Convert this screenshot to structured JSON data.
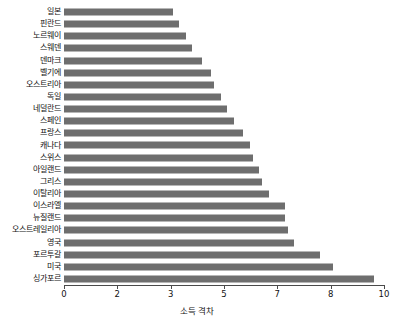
{
  "chart_data": {
    "type": "bar",
    "orientation": "horizontal",
    "title": "",
    "subtitle": "",
    "xlabel": "소득 격차",
    "ylabel": "",
    "xlim": [
      0,
      10
    ],
    "ylim": null,
    "grid": false,
    "legend": null,
    "legend_position": "none",
    "bar_color": "#6e6e6e",
    "axis_color": "#4a4a4a",
    "background_color": "#ffffff",
    "x_ticks": [
      {
        "value": 0,
        "label": "0"
      },
      {
        "value": 1.6667,
        "label": "2"
      },
      {
        "value": 3.3333,
        "label": "3"
      },
      {
        "value": 5,
        "label": "5"
      },
      {
        "value": 6.6667,
        "label": "7"
      },
      {
        "value": 8.3333,
        "label": "8"
      },
      {
        "value": 10,
        "label": "10"
      }
    ],
    "categories": [
      "일본",
      "핀란드",
      "노르웨이",
      "스웨덴",
      "덴마크",
      "벨기에",
      "오스트리아",
      "독일",
      "네덜란드",
      "스페인",
      "프랑스",
      "캐나다",
      "스위스",
      "아일랜드",
      "그리스",
      "이탈리아",
      "이스라엘",
      "뉴질랜드",
      "오스트레일리아",
      "영국",
      "포르투갈",
      "미국",
      "싱가포르"
    ],
    "values": [
      3.4,
      3.6,
      3.8,
      4.0,
      4.3,
      4.6,
      4.7,
      4.9,
      5.1,
      5.3,
      5.6,
      5.8,
      5.9,
      6.1,
      6.2,
      6.4,
      6.9,
      6.9,
      7.0,
      7.2,
      8.0,
      8.4,
      9.7
    ],
    "series": [
      {
        "name": "소득 격차",
        "values": [
          3.4,
          3.6,
          3.8,
          4.0,
          4.3,
          4.6,
          4.7,
          4.9,
          5.1,
          5.3,
          5.6,
          5.8,
          5.9,
          6.1,
          6.2,
          6.4,
          6.9,
          6.9,
          7.0,
          7.2,
          8.0,
          8.4,
          9.7
        ]
      }
    ]
  }
}
